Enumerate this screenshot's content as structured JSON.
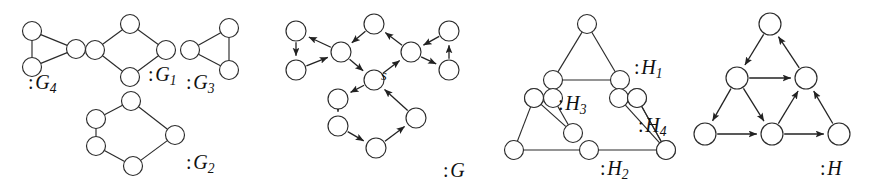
{
  "figure": {
    "background_color": "#ffffff",
    "node_fill": "#ffffff",
    "node_stroke": "#2b2b2b",
    "edge_color": "#2b2b2b"
  },
  "labels": {
    "g4": {
      "colon": ":",
      "letter": "G",
      "sub": "4",
      "x": 28,
      "y": 72
    },
    "g1": {
      "colon": ":",
      "letter": "G",
      "sub": "1",
      "x": 148,
      "y": 64
    },
    "g3": {
      "colon": ":",
      "letter": "G",
      "sub": "3",
      "x": 186,
      "y": 72
    },
    "g2": {
      "colon": ":",
      "letter": "G",
      "sub": "2",
      "x": 186,
      "y": 152
    },
    "g": {
      "colon": ":",
      "letter": "G",
      "sub": "",
      "x": 443,
      "y": 160
    },
    "h1": {
      "colon": ":",
      "letter": "H",
      "sub": "1",
      "x": 634,
      "y": 57
    },
    "h3": {
      "colon": ":",
      "letter": "H",
      "sub": "3",
      "x": 558,
      "y": 93
    },
    "h4": {
      "colon": ":",
      "letter": "H",
      "sub": "4",
      "x": 638,
      "y": 115
    },
    "h2": {
      "colon": ":",
      "letter": "H",
      "sub": "2",
      "x": 600,
      "y": 158
    },
    "h": {
      "colon": ":",
      "letter": "H",
      "sub": "",
      "x": 820,
      "y": 158
    }
  },
  "source_node": {
    "text": "s",
    "x": 381,
    "y": 67
  },
  "graphs": {
    "G4": {
      "name": "G4",
      "directed": false,
      "node_radius": 9.5,
      "nodes": [
        {
          "id": "a",
          "x": 32,
          "y": 31
        },
        {
          "id": "b",
          "x": 32,
          "y": 67
        },
        {
          "id": "c",
          "x": 76,
          "y": 49
        }
      ],
      "edges": [
        [
          "a",
          "b"
        ],
        [
          "a",
          "c"
        ],
        [
          "b",
          "c"
        ]
      ]
    },
    "G1": {
      "name": "G1",
      "directed": false,
      "node_radius": 9.5,
      "nodes": [
        {
          "id": "t",
          "x": 130,
          "y": 24
        },
        {
          "id": "l",
          "x": 95,
          "y": 50
        },
        {
          "id": "r",
          "x": 166,
          "y": 50
        },
        {
          "id": "b",
          "x": 130,
          "y": 77
        }
      ],
      "edges": [
        [
          "t",
          "l"
        ],
        [
          "t",
          "r"
        ],
        [
          "l",
          "b"
        ],
        [
          "r",
          "b"
        ]
      ]
    },
    "G3": {
      "name": "G3",
      "directed": false,
      "node_radius": 9.5,
      "nodes": [
        {
          "id": "l",
          "x": 190,
          "y": 50
        },
        {
          "id": "rt",
          "x": 229,
          "y": 28
        },
        {
          "id": "rb",
          "x": 229,
          "y": 70
        }
      ],
      "edges": [
        [
          "l",
          "rt"
        ],
        [
          "l",
          "rb"
        ],
        [
          "rt",
          "rb"
        ]
      ]
    },
    "G2": {
      "name": "G2",
      "directed": false,
      "node_radius": 9.5,
      "nodes": [
        {
          "id": "t",
          "x": 131,
          "y": 101
        },
        {
          "id": "ul",
          "x": 96,
          "y": 119
        },
        {
          "id": "ll",
          "x": 96,
          "y": 146
        },
        {
          "id": "b",
          "x": 133,
          "y": 166
        },
        {
          "id": "r",
          "x": 175,
          "y": 135
        }
      ],
      "edges": [
        [
          "t",
          "ul"
        ],
        [
          "ul",
          "ll"
        ],
        [
          "ll",
          "b"
        ],
        [
          "b",
          "r"
        ],
        [
          "r",
          "t"
        ]
      ]
    },
    "G": {
      "name": "G",
      "directed": true,
      "node_radius": 10,
      "nodes": [
        {
          "id": "lt",
          "x": 296,
          "y": 31
        },
        {
          "id": "lb",
          "x": 296,
          "y": 70
        },
        {
          "id": "cl",
          "x": 341,
          "y": 52
        },
        {
          "id": "top",
          "x": 374,
          "y": 24
        },
        {
          "id": "cr",
          "x": 411,
          "y": 52
        },
        {
          "id": "rt",
          "x": 449,
          "y": 31
        },
        {
          "id": "rb",
          "x": 449,
          "y": 70
        },
        {
          "id": "s",
          "x": 374,
          "y": 80
        },
        {
          "id": "ul",
          "x": 338,
          "y": 99
        },
        {
          "id": "ll",
          "x": 338,
          "y": 126
        },
        {
          "id": "bm",
          "x": 376,
          "y": 148
        },
        {
          "id": "br",
          "x": 416,
          "y": 118
        }
      ],
      "edges": [
        [
          "cl",
          "lt"
        ],
        [
          "lt",
          "lb"
        ],
        [
          "lb",
          "cl"
        ],
        [
          "top",
          "cl"
        ],
        [
          "cl",
          "s"
        ],
        [
          "s",
          "cr"
        ],
        [
          "cr",
          "top"
        ],
        [
          "rt",
          "cr"
        ],
        [
          "cr",
          "rb"
        ],
        [
          "rb",
          "rt"
        ],
        [
          "s",
          "ul"
        ],
        [
          "ul",
          "ll"
        ],
        [
          "ll",
          "bm"
        ],
        [
          "bm",
          "br"
        ],
        [
          "br",
          "s"
        ]
      ]
    },
    "H1": {
      "name": "H1",
      "directed": false,
      "node_radius": 9.5,
      "nodes": [
        {
          "id": "apex",
          "x": 587,
          "y": 24
        },
        {
          "id": "bl",
          "x": 553,
          "y": 80
        },
        {
          "id": "br",
          "x": 620,
          "y": 80
        }
      ],
      "edges": [
        [
          "apex",
          "bl"
        ],
        [
          "apex",
          "br"
        ],
        [
          "bl",
          "br"
        ]
      ]
    },
    "H3": {
      "name": "H3",
      "directed": false,
      "node_radius": 9.5,
      "nodes": [
        {
          "id": "l",
          "x": 534,
          "y": 98
        },
        {
          "id": "r",
          "x": 553,
          "y": 98
        },
        {
          "id": "b",
          "x": 573,
          "y": 133
        }
      ],
      "edges": [
        [
          "l",
          "b"
        ],
        [
          "r",
          "b"
        ]
      ]
    },
    "H4": {
      "name": "H4",
      "directed": false,
      "node_radius": 9.5,
      "nodes": [
        {
          "id": "l",
          "x": 619,
          "y": 98
        },
        {
          "id": "r",
          "x": 637,
          "y": 98
        },
        {
          "id": "b",
          "x": 666,
          "y": 150
        }
      ],
      "edges": [
        [
          "l",
          "b"
        ],
        [
          "r",
          "b"
        ]
      ]
    },
    "H2": {
      "name": "H2",
      "directed": false,
      "node_radius": 9.5,
      "nodes": [
        {
          "id": "bl",
          "x": 514,
          "y": 150
        },
        {
          "id": "bm",
          "x": 589,
          "y": 150
        },
        {
          "id": "br",
          "x": 666,
          "y": 150
        },
        {
          "id": "ul",
          "x": 534,
          "y": 98
        },
        {
          "id": "ur",
          "x": 637,
          "y": 98
        }
      ],
      "edges": [
        [
          "bl",
          "bm"
        ],
        [
          "bm",
          "br"
        ],
        [
          "bl",
          "ul"
        ],
        [
          "br",
          "ur"
        ]
      ]
    },
    "H": {
      "name": "H",
      "directed": true,
      "node_radius": 11,
      "nodes": [
        {
          "id": "apex",
          "x": 770,
          "y": 24
        },
        {
          "id": "ml",
          "x": 737,
          "y": 78
        },
        {
          "id": "mr",
          "x": 806,
          "y": 78
        },
        {
          "id": "bl",
          "x": 705,
          "y": 134
        },
        {
          "id": "bm",
          "x": 772,
          "y": 134
        },
        {
          "id": "br",
          "x": 839,
          "y": 134
        }
      ],
      "edges": [
        [
          "apex",
          "ml"
        ],
        [
          "ml",
          "mr"
        ],
        [
          "mr",
          "apex"
        ],
        [
          "ml",
          "bl"
        ],
        [
          "ml",
          "bm"
        ],
        [
          "bl",
          "bm"
        ],
        [
          "bm",
          "mr"
        ],
        [
          "bm",
          "br"
        ],
        [
          "br",
          "mr"
        ]
      ]
    }
  }
}
